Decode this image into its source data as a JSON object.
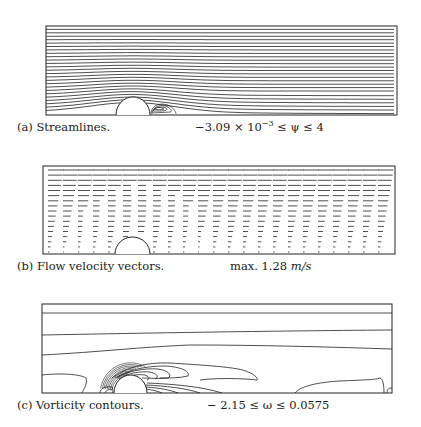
{
  "figures": [
    {
      "id": "a",
      "caption": "(a) Streamlines.",
      "range_prefix": "−3.09 × 10",
      "range_exp": "−3",
      "range_suffix": " ≤ ψ ≤ 4",
      "plot_type": "streamlines"
    },
    {
      "id": "b",
      "caption": "(b) Flow velocity vectors.",
      "range_prefix": "max. 1.28 ",
      "range_unit": "m/s",
      "plot_type": "velocity-vectors"
    },
    {
      "id": "c",
      "caption": "(c) Vorticity contours.",
      "range_text": "− 2.15 ≤ ω ≤ 0.0575",
      "plot_type": "vorticity-contours"
    }
  ],
  "chart_data": [
    {
      "type": "contour",
      "title": "(a) Streamlines.",
      "variable": "psi",
      "min": -0.00309,
      "max": 4,
      "annotation": "-3.09 x 10^-3 <= psi <= 4",
      "feature": "semicircular obstacle on lower wall with recirculation bubble downstream"
    },
    {
      "type": "vector",
      "title": "(b) Flow velocity vectors.",
      "variable": "velocity",
      "max_magnitude": 1.28,
      "unit": "m/s",
      "annotation": "max. 1.28 m/s"
    },
    {
      "type": "contour",
      "title": "(c) Vorticity contours.",
      "variable": "omega",
      "min": -2.15,
      "max": 0.0575,
      "annotation": "- 2.15 <= omega <= 0.0575"
    }
  ]
}
